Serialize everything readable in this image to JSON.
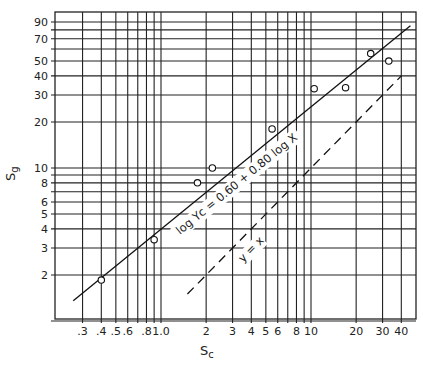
{
  "chart_data": {
    "type": "scatter",
    "title": "",
    "xlabel": "Sc",
    "ylabel": "Sg",
    "xlabel_main": "S",
    "xlabel_sub": "c",
    "ylabel_main": "S",
    "ylabel_sub": "g",
    "xscale": "log",
    "yscale": "log",
    "xlim": [
      0.2,
      50
    ],
    "ylim": [
      1,
      100
    ],
    "grid": true,
    "x_ticks": [
      0.3,
      0.4,
      0.5,
      0.6,
      0.8,
      1.0,
      2,
      3,
      4,
      5,
      6,
      8,
      10,
      20,
      30,
      40
    ],
    "x_tick_labels": [
      ".3",
      ".4",
      ".5",
      ".6",
      ".8",
      "1.0",
      "2",
      "3",
      "4",
      "5",
      "6",
      "8",
      "10",
      "20",
      "30",
      "40"
    ],
    "x_gridlines": [
      0.3,
      0.4,
      0.5,
      0.6,
      0.7,
      0.8,
      0.9,
      1.0,
      2,
      3,
      4,
      5,
      6,
      7,
      8,
      9,
      10,
      20,
      30,
      40
    ],
    "y_ticks": [
      2,
      3,
      4,
      5,
      6,
      8,
      10,
      20,
      30,
      40,
      50,
      70,
      90
    ],
    "y_tick_labels": [
      "2",
      "3",
      "4",
      "5",
      "6",
      "8",
      "10",
      "20",
      "30",
      "40",
      "50",
      "70",
      "90"
    ],
    "y_gridlines": [
      1,
      2,
      3,
      4,
      5,
      6,
      7,
      8,
      9,
      10,
      20,
      30,
      40,
      50,
      60,
      70,
      80,
      90
    ],
    "series": [
      {
        "name": "observed",
        "marker": "open-circle",
        "points": [
          {
            "x": 0.4,
            "y": 1.85
          },
          {
            "x": 0.9,
            "y": 3.4
          },
          {
            "x": 1.75,
            "y": 8.0
          },
          {
            "x": 2.2,
            "y": 10.0
          },
          {
            "x": 5.5,
            "y": 18.0
          },
          {
            "x": 10.5,
            "y": 33.0
          },
          {
            "x": 17.0,
            "y": 33.5
          },
          {
            "x": 25.0,
            "y": 56.0
          },
          {
            "x": 33.0,
            "y": 50.0
          }
        ]
      },
      {
        "name": "regression",
        "style": "solid",
        "equation": "log Yc = 0.60 + 0.80 log X",
        "x_range": [
          0.26,
          46
        ]
      },
      {
        "name": "identity",
        "style": "dashed",
        "equation": "y = x",
        "x_range": [
          1.5,
          40
        ]
      }
    ],
    "annotations": [
      {
        "text": "log Yc = 0.60 + 0.80 log X",
        "target": "regression"
      },
      {
        "text": "y = x",
        "target": "identity"
      }
    ]
  },
  "labels": {
    "regression_label": "log Yc = 0.60 + 0.80 log X",
    "identity_label": "y = x"
  }
}
